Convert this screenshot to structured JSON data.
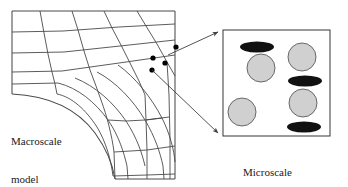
{
  "figure": {
    "type": "multiscale-model-diagram",
    "background_color": "#ffffff",
    "line_color": "#3f3f3f",
    "text_color": "#1a1a1a"
  },
  "macroscale": {
    "label_line1": "Macroscale",
    "label_line2": "model",
    "description": "finite element mesh of a filleted structural corner",
    "mesh_line_color": "#4a4a4a",
    "integration_point_dots": 4,
    "dot_color": "#000000"
  },
  "microscale": {
    "label_line1": "Microscale",
    "label_line2": "model",
    "description": "representative volume element with inclusions",
    "box_border_color": "#3f3f3f",
    "circle_fill": "#d0d0d0",
    "circle_stroke": "#5a5a5a",
    "ellipse_fill": "#111111",
    "circles": [
      {
        "cx": 261,
        "cy": 68,
        "r": 14
      },
      {
        "cx": 302,
        "cy": 57,
        "r": 14
      },
      {
        "cx": 242,
        "cy": 112,
        "r": 14
      },
      {
        "cx": 303,
        "cy": 103,
        "r": 14
      }
    ],
    "ellipses": [
      {
        "cx": 257,
        "cy": 47,
        "rx": 17,
        "ry": 5.5
      },
      {
        "cx": 305,
        "cy": 81,
        "rx": 17,
        "ry": 5.5
      },
      {
        "cx": 304,
        "cy": 127,
        "rx": 17,
        "ry": 5.5
      }
    ]
  },
  "connectors": {
    "arrow_color": "#3f3f3f",
    "arrow_upper": "from macroscale dot cluster to microscale box top-left corner",
    "arrow_lower": "from macroscale dot cluster to microscale box bottom-left corner"
  }
}
